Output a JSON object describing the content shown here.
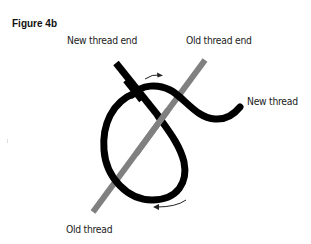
{
  "figure": {
    "title": "Figure 4b"
  },
  "labels": {
    "new_thread_end": "New thread end",
    "old_thread_end": "Old thread end",
    "new_thread": "New thread",
    "old_thread": "Old thread"
  },
  "colors": {
    "new_thread": "#000000",
    "old_thread": "#808080",
    "arrow": "#222222",
    "background": "#ffffff"
  },
  "icons": {
    "top_arrow": "arrow-right-curved",
    "bottom_arrow": "arrow-left-curved"
  }
}
